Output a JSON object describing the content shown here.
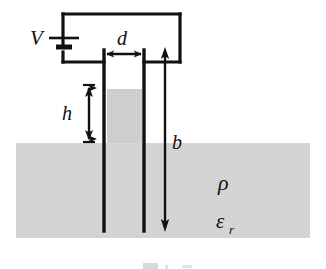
{
  "figure": {
    "domain_type": "physics-schematic"
  },
  "labels": {
    "voltage_source": "V",
    "plate_separation": "d",
    "height_above_ground": "h",
    "plate_depth": "b",
    "resistivity": "ρ",
    "relative_permittivity_base": "ε",
    "relative_permittivity_subscript": "r"
  },
  "caption": {
    "partial_text": "",
    "visible": false
  },
  "colors": {
    "ink": "#111111",
    "ground_fill": "#d4d4d4",
    "liquid_fill": "#cfcfcf",
    "background": "#ffffff"
  },
  "geometry": {
    "ground_surface_y": 143,
    "ground_left_x": 16,
    "ground_right_x": 310,
    "ground_bottom_y": 238,
    "left_plate_x": 104,
    "right_plate_x": 144,
    "plate_top_y": 50,
    "plate_bottom_y": 231,
    "liquid_top_y": 89,
    "b_arrow_x": 165,
    "b_arrow_top_y": 48,
    "b_arrow_bottom_y": 231,
    "h_arrow_x": 89,
    "h_arrow_top_y": 85,
    "h_arrow_bottom_y": 142,
    "circuit_top_y": 14,
    "circuit_left_x": 63,
    "circuit_right_x": 180,
    "circuit_bottom_y": 62,
    "battery_y": 38,
    "d_arrow_y": 54
  }
}
